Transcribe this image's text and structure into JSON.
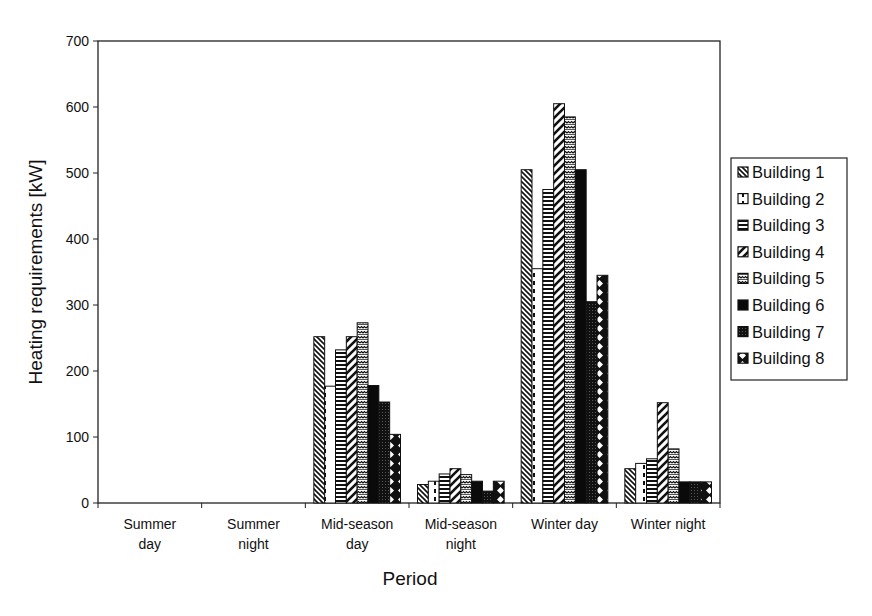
{
  "chart_data": {
    "type": "bar",
    "title": "",
    "xlabel": "Period",
    "ylabel": "Heating requirements [kW]",
    "ylim": [
      0,
      700
    ],
    "yticks": [
      0,
      100,
      200,
      300,
      400,
      500,
      600,
      700
    ],
    "grid": false,
    "legend_position": "right",
    "categories": [
      [
        "Summer",
        "day"
      ],
      [
        "Summer",
        "night"
      ],
      [
        "Mid-season",
        "day"
      ],
      [
        "Mid-season",
        "night"
      ],
      [
        "Winter day"
      ],
      [
        "Winter night"
      ]
    ],
    "series": [
      {
        "name": "Building 1",
        "pattern": "diag-left",
        "values": [
          0,
          0,
          252,
          28,
          505,
          52
        ]
      },
      {
        "name": "Building 2",
        "pattern": "dashed-vert",
        "values": [
          0,
          0,
          177,
          33,
          355,
          60
        ]
      },
      {
        "name": "Building 3",
        "pattern": "horiz",
        "values": [
          0,
          0,
          232,
          44,
          475,
          67
        ]
      },
      {
        "name": "Building 4",
        "pattern": "diag-wide",
        "values": [
          0,
          0,
          252,
          52,
          605,
          152
        ]
      },
      {
        "name": "Building 5",
        "pattern": "wave",
        "values": [
          0,
          0,
          273,
          43,
          585,
          82
        ]
      },
      {
        "name": "Building 6",
        "pattern": "solid",
        "values": [
          0,
          0,
          178,
          33,
          505,
          32
        ]
      },
      {
        "name": "Building 7",
        "pattern": "dense-dot",
        "values": [
          0,
          0,
          153,
          18,
          305,
          32
        ]
      },
      {
        "name": "Building 8",
        "pattern": "diamond",
        "values": [
          0,
          0,
          104,
          33,
          345,
          32
        ]
      }
    ]
  }
}
